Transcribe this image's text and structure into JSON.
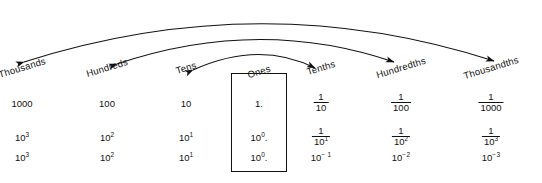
{
  "diagram": {
    "background_color": "#ffffff",
    "line_color": "#111111",
    "columns": [
      {
        "id": "thousands",
        "label": "Thousands",
        "x": 22,
        "value": "1000",
        "power_fraction": "10",
        "power_fraction_exp": "3",
        "power_plain": "10",
        "power_plain_exp": "3",
        "boxed": false
      },
      {
        "id": "hundreds",
        "label": "Hundreds",
        "x": 107,
        "value": "100",
        "power_fraction": "10",
        "power_fraction_exp": "2",
        "power_plain": "10",
        "power_plain_exp": "2",
        "boxed": false
      },
      {
        "id": "tens",
        "label": "Tens",
        "x": 186,
        "value": "10",
        "power_fraction": "10",
        "power_fraction_exp": "1",
        "power_plain": "10",
        "power_plain_exp": "1",
        "boxed": false
      },
      {
        "id": "ones",
        "label": "Ones",
        "x": 259,
        "value": "1.",
        "power_fraction": "10",
        "power_fraction_exp": "0",
        "power_plain": "10",
        "power_plain_exp": "0",
        "boxed": true
      },
      {
        "id": "tenths",
        "label": "Tenths",
        "x": 321,
        "fraction_numerator": "1",
        "fraction_denominator": "10",
        "power_fraction_numerator": "1",
        "power_fraction_denominator": "10",
        "power_fraction_denominator_exp": "1",
        "power_plain": "10",
        "power_plain_exp": "− 1",
        "boxed": false
      },
      {
        "id": "hundredths",
        "label": "Hundredths",
        "x": 401,
        "fraction_numerator": "1",
        "fraction_denominator": "100",
        "power_fraction_numerator": "1",
        "power_fraction_denominator": "10",
        "power_fraction_denominator_exp": "2",
        "power_plain": "10",
        "power_plain_exp": "−2",
        "boxed": false
      },
      {
        "id": "thousandths",
        "label": "Thousandths",
        "x": 491,
        "fraction_numerator": "1",
        "fraction_denominator": "1000",
        "power_fraction_numerator": "1",
        "power_fraction_denominator": "10",
        "power_fraction_denominator_exp": "3",
        "power_plain": "10",
        "power_plain_exp": "−3",
        "boxed": false
      }
    ],
    "arcs": [
      {
        "id": "arc-inner",
        "from": "tens",
        "to": "tenths",
        "label": ""
      },
      {
        "id": "arc-middle",
        "from": "hundreds",
        "to": "hundredths",
        "label": ""
      },
      {
        "id": "arc-outer",
        "from": "thousands",
        "to": "thousandths",
        "label": ""
      }
    ],
    "ones_box": {
      "x": 231,
      "y": 73,
      "width": 56,
      "height": 99
    }
  }
}
